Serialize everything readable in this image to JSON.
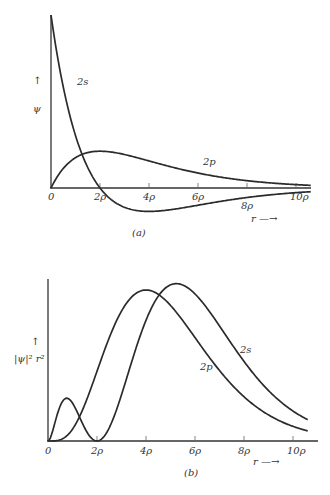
{
  "chart_data": [
    {
      "id": "a",
      "type": "line",
      "caption": "(a)",
      "title": "",
      "xlabel": "r",
      "ylabel": "ψ",
      "x_ticks": [
        "0",
        "2ρ",
        "4ρ",
        "6ρ",
        "8ρ",
        "10ρ"
      ],
      "x_tick_values": [
        0,
        2,
        4,
        6,
        8,
        10
      ],
      "xlim": [
        0,
        10.6
      ],
      "grid": false,
      "legend": "inline curve labels",
      "series": [
        {
          "name": "2s",
          "formula": "(2 - r) * exp(-r/2)",
          "x": [
            0,
            0.5,
            1,
            1.5,
            2,
            3,
            4,
            5,
            6,
            7,
            8,
            9,
            10,
            10.6
          ],
          "values": [
            2.0,
            1.168,
            0.607,
            0.236,
            0.0,
            -0.223,
            -0.271,
            -0.246,
            -0.199,
            -0.151,
            -0.11,
            -0.078,
            -0.054,
            -0.043
          ]
        },
        {
          "name": "2p",
          "formula": "r * exp(-r/2)",
          "x": [
            0,
            0.5,
            1,
            1.5,
            2,
            3,
            4,
            5,
            6,
            7,
            8,
            9,
            10,
            10.6
          ],
          "values": [
            0.0,
            0.389,
            0.607,
            0.709,
            0.736,
            0.669,
            0.541,
            0.41,
            0.299,
            0.211,
            0.147,
            0.1,
            0.067,
            0.053
          ]
        }
      ]
    },
    {
      "id": "b",
      "type": "line",
      "caption": "(b)",
      "title": "",
      "xlabel": "r",
      "ylabel": "|ψ|² r²",
      "x_ticks": [
        "0",
        "2ρ",
        "4ρ",
        "6ρ",
        "8ρ",
        "10ρ"
      ],
      "x_tick_values": [
        0,
        2,
        4,
        6,
        8,
        10
      ],
      "xlim": [
        0,
        10.8
      ],
      "grid": false,
      "legend": "inline curve labels",
      "series": [
        {
          "name": "2s",
          "formula": "(2 - r)^2 r^2 exp(-r)",
          "peaks": [
            {
              "r": 0.76,
              "rel": 0.27
            },
            {
              "r": 5.24,
              "rel": 1.0
            }
          ],
          "node": 2
        },
        {
          "name": "2p",
          "formula": "r^4 exp(-r)",
          "peaks": [
            {
              "r": 4.0,
              "rel": 0.96
            }
          ]
        }
      ]
    }
  ],
  "labels": {
    "a": {
      "caption": "(a)",
      "y_axis": "ψ",
      "y_arrow": "↑",
      "x_axis": "r —→",
      "curve_2s": "2s",
      "curve_2p": "2p",
      "ticks": [
        "0",
        "2ρ",
        "4ρ",
        "6ρ",
        "8ρ",
        "10ρ"
      ]
    },
    "b": {
      "caption": "(b)",
      "y_axis": "|ψ|² r²",
      "y_arrow": "↑",
      "x_axis": "r —→",
      "curve_2s": "2s",
      "curve_2p": "2p",
      "ticks": [
        "0",
        "2ρ",
        "4ρ",
        "6ρ",
        "8ρ",
        "10ρ"
      ]
    }
  }
}
